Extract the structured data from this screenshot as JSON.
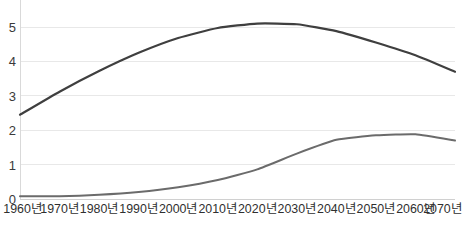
{
  "chart_data": {
    "type": "line",
    "title": "",
    "subtitle": "",
    "xlabel": "",
    "ylabel": "",
    "x": [
      "1960년",
      "1970년",
      "1980년",
      "1990년",
      "2000년",
      "2010년",
      "2020년",
      "2030년",
      "2040년",
      "2050년",
      "2060년",
      "2070년"
    ],
    "categories": [
      "1960년",
      "1970년",
      "1980년",
      "1990년",
      "2000년",
      "2010년",
      "2020년",
      "2030년",
      "2040년",
      "2050년",
      "2060년",
      "2070년"
    ],
    "xlim": [
      1960,
      2070
    ],
    "ylim": [
      0,
      5.6
    ],
    "yticks": [
      0,
      1,
      2,
      3,
      4,
      5
    ],
    "ytick_labels": [
      "0",
      "1",
      "2",
      "3",
      "4",
      "5"
    ],
    "grid": true,
    "grid_axis": "y",
    "legend": "none",
    "series": [
      {
        "name": "upper-series",
        "color": "#3f3f3f",
        "width": 2.2,
        "values": [
          2.45,
          3.12,
          3.72,
          4.25,
          4.68,
          4.97,
          5.1,
          5.08,
          4.88,
          4.55,
          4.18,
          3.7
        ]
      },
      {
        "name": "lower-series",
        "color": "#6b6b6b",
        "width": 2.0,
        "values": [
          0.08,
          0.08,
          0.12,
          0.2,
          0.34,
          0.55,
          0.86,
          1.32,
          1.72,
          1.85,
          1.88,
          1.7
        ]
      }
    ]
  },
  "axis": {
    "y_ticks": [
      "5",
      "4",
      "3",
      "2",
      "1",
      "0"
    ],
    "x_ticks": [
      "1960년",
      "1970년",
      "1980년",
      "1990년",
      "2000년",
      "2010년",
      "2020년",
      "2030년",
      "2040년",
      "2050년",
      "2060년",
      "2070년"
    ]
  },
  "colors": {
    "background": "#ffffff",
    "gridline": "#e8e8e8",
    "axis_line": "#d9d9d9",
    "baseline": "#d0d0d0",
    "upper_line": "#3f3f3f",
    "lower_line": "#6b6b6b",
    "tick_text": "#2f2f2f"
  }
}
